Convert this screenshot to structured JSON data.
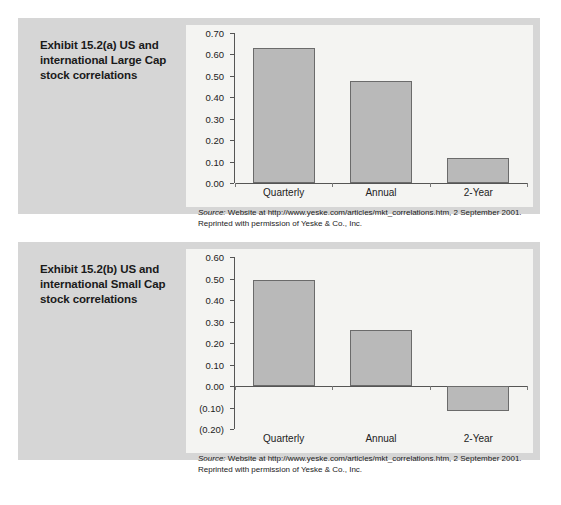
{
  "exhibits": [
    {
      "id": "a",
      "title": "Exhibit 15.2(a)  US and international Large Cap stock correlations",
      "source_word": "Source:",
      "source_line1": " Website at http://www.yeske.com/articles/mkt_correlations.htm, 2 September 2001.",
      "source_line2": "Reprinted with permission of Yeske & Co., Inc.",
      "chart_data": {
        "type": "bar",
        "title": "",
        "xlabel": "",
        "ylabel": "",
        "categories": [
          "Quarterly",
          "Annual",
          "2-Year"
        ],
        "values": [
          0.63,
          0.475,
          0.115
        ],
        "tick_labels": [
          "0.70",
          "0.60",
          "0.50",
          "0.40",
          "0.30",
          "0.20",
          "0.10",
          "0.00"
        ],
        "tick_values": [
          0.7,
          0.6,
          0.5,
          0.4,
          0.3,
          0.2,
          0.1,
          0.0
        ],
        "ylim": [
          0.0,
          0.7
        ],
        "grid": false,
        "legend": "none",
        "bar_color": "#b9b9b9",
        "bar_border_color": "#6b6b6b"
      }
    },
    {
      "id": "b",
      "title": "Exhibit 15.2(b)  US and international Small Cap stock correlations",
      "source_word": "Source:",
      "source_line1": " Website at http://www.yeske.com/articles/mkt_correlations.htm, 2 September 2001.",
      "source_line2": "Reprinted with permission of Yeske & Co., Inc.",
      "chart_data": {
        "type": "bar",
        "title": "",
        "xlabel": "",
        "ylabel": "",
        "categories": [
          "Quarterly",
          "Annual",
          "2-Year"
        ],
        "values": [
          0.495,
          0.26,
          -0.115
        ],
        "tick_labels": [
          "0.60",
          "0.50",
          "0.40",
          "0.30",
          "0.20",
          "0.10",
          "0.00",
          "(0.10)",
          "(0.20)"
        ],
        "tick_values": [
          0.6,
          0.5,
          0.4,
          0.3,
          0.2,
          0.1,
          0.0,
          -0.1,
          -0.2
        ],
        "ylim": [
          -0.2,
          0.6
        ],
        "grid": false,
        "legend": "none",
        "bar_color": "#b9b9b9",
        "bar_border_color": "#6b6b6b"
      }
    }
  ],
  "colors": {
    "panel_background": "#d6d6d6",
    "chart_background": "#f4f4f2",
    "page_background": "#ffffff",
    "axis": "#555555",
    "text": "#1a1a1a"
  }
}
